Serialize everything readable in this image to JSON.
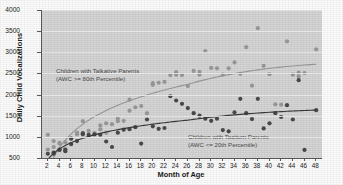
{
  "chart_data": {
    "type": "scatter",
    "title": "",
    "xlabel": "Month of Age",
    "ylabel": "Daily Child Vocalizations",
    "xlim": [
      1,
      49
    ],
    "ylim": [
      500,
      4000
    ],
    "xticks": [
      2,
      4,
      6,
      8,
      10,
      12,
      14,
      16,
      18,
      20,
      22,
      24,
      26,
      28,
      30,
      32,
      34,
      36,
      38,
      40,
      42,
      44,
      46,
      48
    ],
    "yticks": [
      500,
      1000,
      1500,
      2000,
      2500,
      3000,
      3500,
      4000
    ],
    "grid": "horizontal",
    "legend": "annotations-in-plot",
    "annotations": [
      {
        "id": "talkative",
        "line1": "Children with Talkative Parents",
        "line2": "(AWC >= 80th Percentile)",
        "color": "#6e6e6e"
      },
      {
        "id": "taciturn",
        "line1": "Children with Taciturn Parents",
        "line2": "(AWC <= 20th Percentile)",
        "color": "#6e6e6e"
      }
    ],
    "series": [
      {
        "name": "Children with Talkative Parents (AWC >= 80th Percentile)",
        "marker_color": "#9a9a9a",
        "line_color": "#9a9a9a",
        "points": [
          [
            2,
            1050
          ],
          [
            2,
            700
          ],
          [
            3,
            900
          ],
          [
            3,
            760
          ],
          [
            4,
            860
          ],
          [
            4,
            840
          ],
          [
            5,
            870
          ],
          [
            5,
            700
          ],
          [
            6,
            960
          ],
          [
            6,
            830
          ],
          [
            7,
            1100
          ],
          [
            7,
            1060
          ],
          [
            8,
            1370
          ],
          [
            8,
            1090
          ],
          [
            9,
            1140
          ],
          [
            9,
            1020
          ],
          [
            10,
            1090
          ],
          [
            10,
            1060
          ],
          [
            11,
            1270
          ],
          [
            11,
            1180
          ],
          [
            12,
            1320
          ],
          [
            12,
            1100
          ],
          [
            13,
            1300
          ],
          [
            14,
            1430
          ],
          [
            14,
            1370
          ],
          [
            15,
            1380
          ],
          [
            16,
            1880
          ],
          [
            16,
            1620
          ],
          [
            17,
            1700
          ],
          [
            18,
            1730
          ],
          [
            19,
            1560
          ],
          [
            20,
            2270
          ],
          [
            20,
            2230
          ],
          [
            21,
            2280
          ],
          [
            22,
            2300
          ],
          [
            23,
            2460
          ],
          [
            24,
            2530
          ],
          [
            24,
            2470
          ],
          [
            25,
            2460
          ],
          [
            26,
            2200
          ],
          [
            27,
            2560
          ],
          [
            28,
            2540
          ],
          [
            28,
            2470
          ],
          [
            29,
            3030
          ],
          [
            30,
            2630
          ],
          [
            31,
            2620
          ],
          [
            32,
            2470
          ],
          [
            33,
            2620
          ],
          [
            34,
            2760
          ],
          [
            35,
            2490
          ],
          [
            36,
            3120
          ],
          [
            37,
            2210
          ],
          [
            38,
            3570
          ],
          [
            39,
            2680
          ],
          [
            40,
            2480
          ],
          [
            41,
            1770
          ],
          [
            42,
            1760
          ],
          [
            43,
            3260
          ],
          [
            44,
            2470
          ],
          [
            45,
            2520
          ],
          [
            45,
            2430
          ],
          [
            46,
            2510
          ],
          [
            48,
            3070
          ]
        ],
        "trend_asymptote": 2700,
        "trend_shape": "logarithmic-saturating"
      },
      {
        "name": "Children with Taciturn Parents (AWC <= 20th Percentile)",
        "marker_color": "#4a4a4a",
        "line_color": "#3a3a3a",
        "points": [
          [
            2,
            600
          ],
          [
            3,
            630
          ],
          [
            3,
            600
          ],
          [
            4,
            700
          ],
          [
            4,
            690
          ],
          [
            5,
            700
          ],
          [
            5,
            660
          ],
          [
            6,
            960
          ],
          [
            6,
            830
          ],
          [
            7,
            900
          ],
          [
            8,
            1080
          ],
          [
            8,
            1060
          ],
          [
            9,
            1050
          ],
          [
            10,
            1060
          ],
          [
            11,
            1050
          ],
          [
            12,
            890
          ],
          [
            13,
            760
          ],
          [
            14,
            1100
          ],
          [
            15,
            1170
          ],
          [
            16,
            1180
          ],
          [
            17,
            1230
          ],
          [
            18,
            840
          ],
          [
            19,
            1410
          ],
          [
            20,
            1250
          ],
          [
            21,
            1190
          ],
          [
            22,
            1210
          ],
          [
            23,
            1960
          ],
          [
            24,
            1860
          ],
          [
            25,
            1780
          ],
          [
            26,
            1680
          ],
          [
            27,
            1560
          ],
          [
            28,
            1500
          ],
          [
            29,
            1430
          ],
          [
            30,
            1380
          ],
          [
            31,
            1430
          ],
          [
            32,
            1160
          ],
          [
            33,
            1130
          ],
          [
            34,
            1580
          ],
          [
            35,
            1900
          ],
          [
            36,
            1560
          ],
          [
            37,
            1420
          ],
          [
            38,
            1900
          ],
          [
            39,
            1200
          ],
          [
            40,
            1320
          ],
          [
            41,
            1560
          ],
          [
            42,
            1470
          ],
          [
            43,
            1750
          ],
          [
            44,
            1410
          ],
          [
            45,
            2340
          ],
          [
            46,
            690
          ],
          [
            48,
            1630
          ]
        ],
        "trend_asymptote": 1650,
        "trend_shape": "logarithmic-saturating"
      }
    ]
  }
}
